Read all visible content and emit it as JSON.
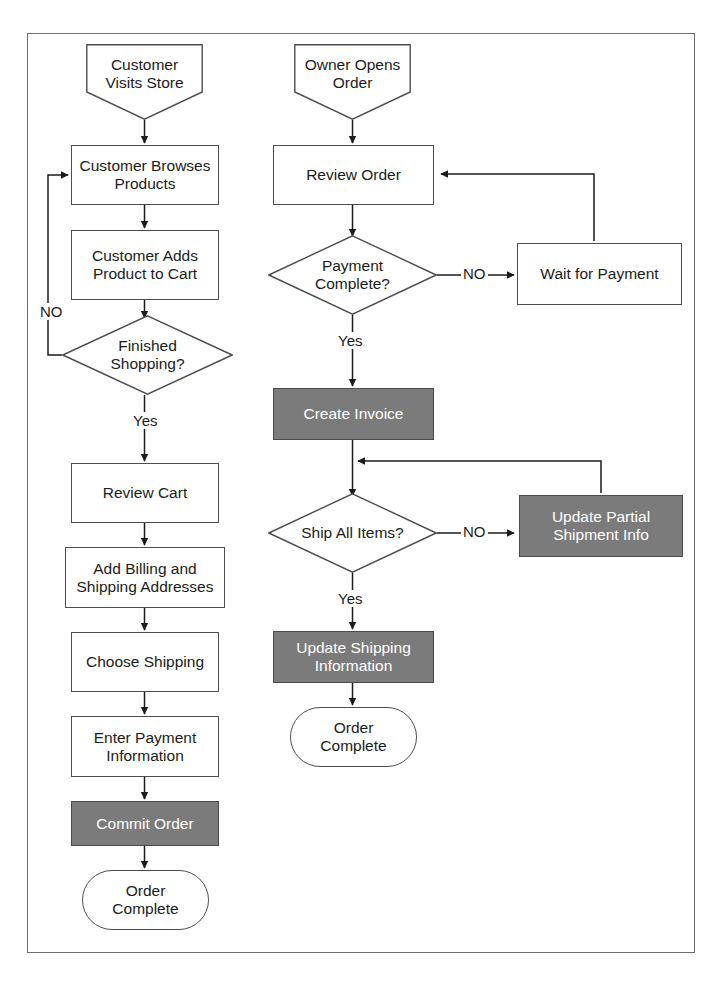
{
  "diagram": {
    "colors": {
      "shaded_fill": "#7b7b7b",
      "shaded_text": "#ffffff",
      "plain_fill": "#ffffff",
      "stroke": "#4d4d4d",
      "frame_stroke": "#6c6c6c",
      "text": "#1b1b1b"
    },
    "lanes": [
      {
        "name": "customer-lane",
        "label": "Customer Visits Store"
      },
      {
        "name": "owner-lane",
        "label": "Owner Opens Order"
      }
    ],
    "nodes": [
      {
        "id": "customer-visits-store",
        "shape": "pentagon",
        "text": "Customer\nVisits Store"
      },
      {
        "id": "customer-browses-products",
        "shape": "process",
        "text": "Customer Browses\nProducts"
      },
      {
        "id": "customer-adds-product-to-cart",
        "shape": "process",
        "text": "Customer Adds\nProduct to Cart"
      },
      {
        "id": "finished-shopping",
        "shape": "decision",
        "text": "Finished\nShopping?"
      },
      {
        "id": "review-cart",
        "shape": "process",
        "text": "Review Cart"
      },
      {
        "id": "add-billing-and-shipping-addresses",
        "shape": "process",
        "text": "Add Billing and\nShipping Addresses"
      },
      {
        "id": "choose-shipping",
        "shape": "process",
        "text": "Choose Shipping"
      },
      {
        "id": "enter-payment-information",
        "shape": "process",
        "text": "Enter Payment\nInformation"
      },
      {
        "id": "commit-order",
        "shape": "shaded",
        "text": "Commit Order"
      },
      {
        "id": "order-complete-customer",
        "shape": "terminal",
        "text": "Order\nComplete"
      },
      {
        "id": "owner-opens-order",
        "shape": "pentagon",
        "text": "Owner Opens\nOrder"
      },
      {
        "id": "review-order",
        "shape": "process",
        "text": "Review Order"
      },
      {
        "id": "payment-complete",
        "shape": "decision",
        "text": "Payment\nComplete?"
      },
      {
        "id": "wait-for-payment",
        "shape": "process",
        "text": "Wait for Payment"
      },
      {
        "id": "create-invoice",
        "shape": "shaded",
        "text": "Create Invoice"
      },
      {
        "id": "ship-all-items",
        "shape": "decision",
        "text": "Ship All Items?"
      },
      {
        "id": "update-partial-shipment-info",
        "shape": "shaded",
        "text": "Update Partial\nShipment Info"
      },
      {
        "id": "update-shipping-information",
        "shape": "shaded",
        "text": "Update Shipping\nInformation"
      },
      {
        "id": "order-complete-owner",
        "shape": "terminal",
        "text": "Order\nComplete"
      }
    ],
    "edge_labels": {
      "finished_shopping_no": "NO",
      "finished_shopping_yes": "Yes",
      "payment_complete_no": "NO",
      "payment_complete_yes": "Yes",
      "ship_all_items_no": "NO",
      "ship_all_items_yes": "Yes"
    },
    "edges": [
      {
        "from": "customer-visits-store",
        "to": "customer-browses-products",
        "label": ""
      },
      {
        "from": "customer-browses-products",
        "to": "customer-adds-product-to-cart",
        "label": ""
      },
      {
        "from": "customer-adds-product-to-cart",
        "to": "finished-shopping",
        "label": ""
      },
      {
        "from": "finished-shopping",
        "to": "customer-browses-products",
        "label": "NO"
      },
      {
        "from": "finished-shopping",
        "to": "review-cart",
        "label": "Yes"
      },
      {
        "from": "review-cart",
        "to": "add-billing-and-shipping-addresses",
        "label": ""
      },
      {
        "from": "add-billing-and-shipping-addresses",
        "to": "choose-shipping",
        "label": ""
      },
      {
        "from": "choose-shipping",
        "to": "enter-payment-information",
        "label": ""
      },
      {
        "from": "enter-payment-information",
        "to": "commit-order",
        "label": ""
      },
      {
        "from": "commit-order",
        "to": "order-complete-customer",
        "label": ""
      },
      {
        "from": "owner-opens-order",
        "to": "review-order",
        "label": ""
      },
      {
        "from": "review-order",
        "to": "payment-complete",
        "label": ""
      },
      {
        "from": "payment-complete",
        "to": "wait-for-payment",
        "label": "NO"
      },
      {
        "from": "wait-for-payment",
        "to": "review-order",
        "label": ""
      },
      {
        "from": "payment-complete",
        "to": "create-invoice",
        "label": "Yes"
      },
      {
        "from": "create-invoice",
        "to": "ship-all-items",
        "label": ""
      },
      {
        "from": "ship-all-items",
        "to": "update-partial-shipment-info",
        "label": "NO"
      },
      {
        "from": "update-partial-shipment-info",
        "to": "ship-all-items",
        "label": ""
      },
      {
        "from": "ship-all-items",
        "to": "update-shipping-information",
        "label": "Yes"
      },
      {
        "from": "update-shipping-information",
        "to": "order-complete-owner",
        "label": ""
      }
    ]
  }
}
